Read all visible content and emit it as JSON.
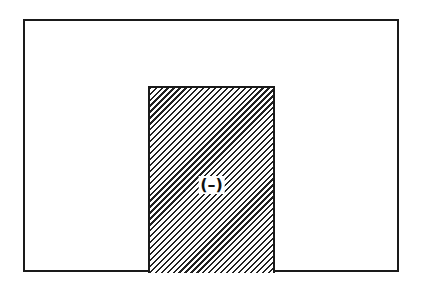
{
  "diagram": {
    "outer_region": {
      "label": ""
    },
    "inner_region": {
      "label": "(–)",
      "fill": "diagonal-hatch"
    }
  },
  "colors": {
    "stroke": "#1a1a1a",
    "background": "#ffffff"
  }
}
